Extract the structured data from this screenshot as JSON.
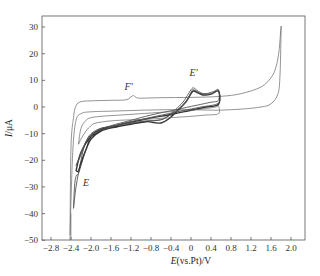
{
  "chart_data": {
    "type": "line",
    "title": "",
    "xlabel": "E(vs.Pt)/V",
    "xlabel_parts": {
      "italic": "E",
      "rest": "(vs.Pt)/V"
    },
    "ylabel": "I/μA",
    "ylabel_parts": {
      "italic": "I",
      "rest": "/μA"
    },
    "xlim": [
      -3.0,
      2.3
    ],
    "ylim": [
      -50,
      35
    ],
    "xticks": [
      -2.8,
      -2.4,
      -2.0,
      -1.6,
      -1.2,
      -0.8,
      -0.4,
      0,
      0.4,
      0.8,
      1.2,
      1.6,
      2.0
    ],
    "xtick_labels": [
      "-2.8",
      "-2.4",
      "-2.0",
      "-1.6",
      "-1.2",
      "-0.8",
      "-0.4",
      "0",
      "0.4",
      "0.8",
      "1.2",
      "1.6",
      "2.0"
    ],
    "yticks": [
      30,
      20,
      10,
      0,
      -10,
      -20,
      -30,
      -40,
      -50
    ],
    "ytick_labels": [
      "30",
      "20",
      "10",
      "0",
      "-10",
      "-20",
      "-30",
      "-40",
      "-50"
    ],
    "grid": false,
    "legend": null,
    "annotations": [
      {
        "text": "F'",
        "x": -1.25,
        "y": 6.5
      },
      {
        "text": "E'",
        "x": 0.05,
        "y": 11.5
      },
      {
        "text": "E",
        "x": -2.1,
        "y": -29.5
      }
    ],
    "series": [
      {
        "name": "wide-window scan",
        "style": "thin",
        "x": [
          -2.42,
          -2.4,
          -2.35,
          -2.3,
          -2.2,
          -2.0,
          -1.6,
          -1.3,
          -1.2,
          -1.15,
          -1.1,
          -1.0,
          -0.6,
          0.0,
          0.6,
          1.0,
          1.4,
          1.6,
          1.7,
          1.76,
          1.8,
          1.8,
          1.78,
          1.74,
          1.6,
          1.4,
          1.0,
          0.5,
          0.0,
          -0.5,
          -1.0,
          -1.5,
          -2.0,
          -2.2,
          -2.3,
          -2.36,
          -2.4,
          -2.42
        ],
        "y": [
          -48,
          -15,
          -4,
          0.5,
          2.0,
          2.3,
          2.5,
          2.7,
          3.8,
          4.3,
          3.6,
          3.3,
          3.5,
          3.6,
          4.0,
          5.0,
          7.5,
          11,
          15,
          21,
          30,
          27,
          12,
          5,
          1.2,
          0.0,
          -0.8,
          -1.2,
          -1.0,
          -1.0,
          -1.2,
          -1.5,
          -1.8,
          -2.5,
          -5,
          -15,
          -35,
          -50
        ]
      },
      {
        "name": "scan 1 (narrow window)",
        "style": "medium",
        "x": [
          -2.35,
          -2.33,
          -2.3,
          -2.25,
          -2.2,
          -2.1,
          -2.0,
          -1.8,
          -1.5,
          -1.2,
          -0.9,
          -0.7,
          -0.5,
          -0.2,
          -0.1,
          0.0,
          0.05,
          0.1,
          0.2,
          0.3,
          0.45,
          0.55,
          0.55,
          0.4,
          0.1,
          -0.3,
          -0.8,
          -1.2,
          -1.6,
          -1.9,
          -2.1,
          -2.2,
          -2.3,
          -2.35
        ],
        "y": [
          -38,
          -30,
          -26,
          -25,
          -22,
          -16,
          -11,
          -8,
          -7.5,
          -6.2,
          -5.4,
          -5.0,
          -4.0,
          1.0,
          3.5,
          6.5,
          7.2,
          6.5,
          5.3,
          5.0,
          5.8,
          6.5,
          2.5,
          1.8,
          0.6,
          -1.0,
          -3.0,
          -5.0,
          -7.0,
          -9.0,
          -13,
          -20,
          -30,
          -38
        ]
      },
      {
        "name": "scan 2 (narrow window)",
        "style": "thick",
        "x": [
          -2.3,
          -2.25,
          -2.2,
          -2.1,
          -2.0,
          -1.8,
          -1.5,
          -1.2,
          -0.9,
          -0.75,
          -0.6,
          -0.45,
          -0.25,
          -0.1,
          0.0,
          0.05,
          0.15,
          0.25,
          0.4,
          0.55,
          0.55,
          0.3,
          0.0,
          -0.4,
          -0.9,
          -1.4,
          -1.8,
          -2.0,
          -2.2,
          -2.3
        ],
        "y": [
          -24,
          -24,
          -21,
          -16,
          -12,
          -9,
          -7.5,
          -6.5,
          -5.5,
          -5.8,
          -6.0,
          -4.5,
          -1.0,
          2.0,
          5.0,
          6.0,
          5.2,
          4.5,
          4.8,
          6.0,
          1.0,
          0.0,
          -1.2,
          -2.8,
          -4.5,
          -6.5,
          -8.5,
          -11,
          -17,
          -24
        ]
      },
      {
        "name": "scan 3 (narrow window)",
        "style": "medium",
        "x": [
          -2.3,
          -2.2,
          -2.1,
          -2.0,
          -1.8,
          -1.5,
          -1.2,
          -0.9,
          -0.6,
          -0.3,
          -0.1,
          0.0,
          0.05,
          0.2,
          0.4,
          0.55,
          0.55,
          0.2,
          -0.2,
          -0.7,
          -1.2,
          -1.6,
          -1.9,
          -2.1,
          -2.3
        ],
        "y": [
          -22,
          -18,
          -13,
          -10,
          -8.0,
          -7.0,
          -6.0,
          -5.2,
          -4.8,
          -1.5,
          2.0,
          5.5,
          6.5,
          5.0,
          5.0,
          5.8,
          1.5,
          0.0,
          -1.5,
          -3.5,
          -5.5,
          -7.5,
          -9.5,
          -13,
          -22
        ]
      },
      {
        "name": "inner scan (narrow window, low current)",
        "style": "thin",
        "x": [
          -2.25,
          -2.2,
          -2.1,
          -2.0,
          -1.8,
          -1.4,
          -1.0,
          -0.6,
          -0.2,
          0.2,
          0.5,
          0.55,
          0.55,
          0.3,
          0.0,
          -0.4,
          -0.8,
          -1.2,
          -1.6,
          -1.9,
          -2.0,
          -2.1,
          -2.2,
          -2.25
        ],
        "y": [
          -14,
          -8,
          -5.0,
          -4.0,
          -3.5,
          -3.0,
          -2.5,
          -2.0,
          -1.5,
          -0.8,
          0.0,
          0.5,
          -2.5,
          -3.0,
          -3.5,
          -4.0,
          -4.5,
          -4.8,
          -5.2,
          -6.0,
          -7.0,
          -9.0,
          -12,
          -14
        ]
      }
    ],
    "plot_frame_px": {
      "left": 42,
      "top": 16,
      "right": 305,
      "bottom": 240
    },
    "x_mapping": {
      "x0_value": 0,
      "x0_px": 191,
      "px_per_unit": 50
    },
    "y_mapping": {
      "y0_value": 0,
      "y0_px": 107,
      "px_per_unit": 2.665
    }
  }
}
